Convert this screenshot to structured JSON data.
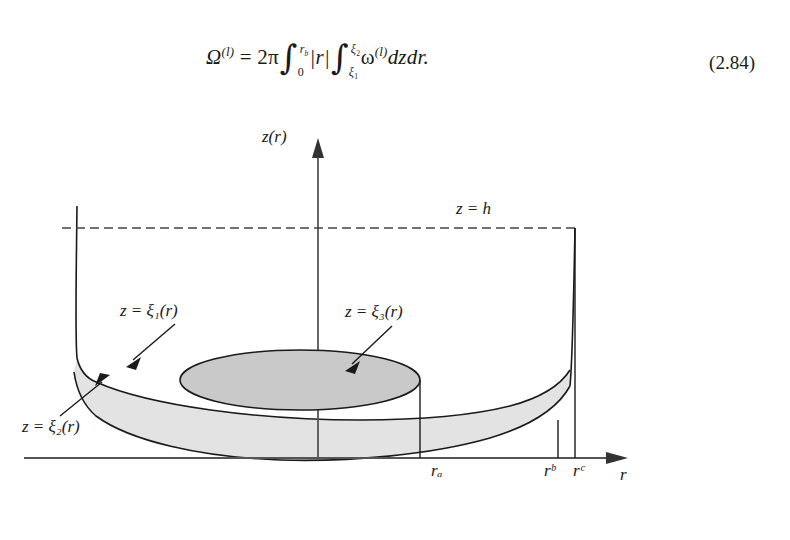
{
  "equation": {
    "lhs_symbol": "Ω",
    "lhs_superscript": "(l)",
    "equals": "=",
    "coefficient": "2π",
    "outer_integral": {
      "lower": "0",
      "upper": "r",
      "upper_sub": "b"
    },
    "integrand_abs": "|r|",
    "inner_integral": {
      "lower": "ξ",
      "lower_sub": "1",
      "upper": "ξ",
      "upper_sub": "2"
    },
    "omega_symbol": "ω",
    "omega_superscript": "(l)",
    "differentials": "dzdr.",
    "number": "(2.84)"
  },
  "figure": {
    "axis_vertical_label": "z(r)",
    "axis_horizontal_label": "r",
    "height_line_label": "z = h",
    "curve_labels": [
      {
        "id": "xi1",
        "text": "z = ξ₁(r)"
      },
      {
        "id": "xi3",
        "text": "z = ξ₃(r)"
      },
      {
        "id": "xi2",
        "text": "z = ξ₂(r)"
      }
    ],
    "tick_labels": [
      {
        "id": "ra",
        "text": "rₐ"
      },
      {
        "id": "rb",
        "text": "rᵇ"
      },
      {
        "id": "rc",
        "text": "rᶜ"
      }
    ],
    "colors": {
      "stroke": "#1a1a1a",
      "shade_light": "#e3e3e3",
      "shade_dark": "#c9c9c9",
      "background": "#ffffff"
    }
  }
}
